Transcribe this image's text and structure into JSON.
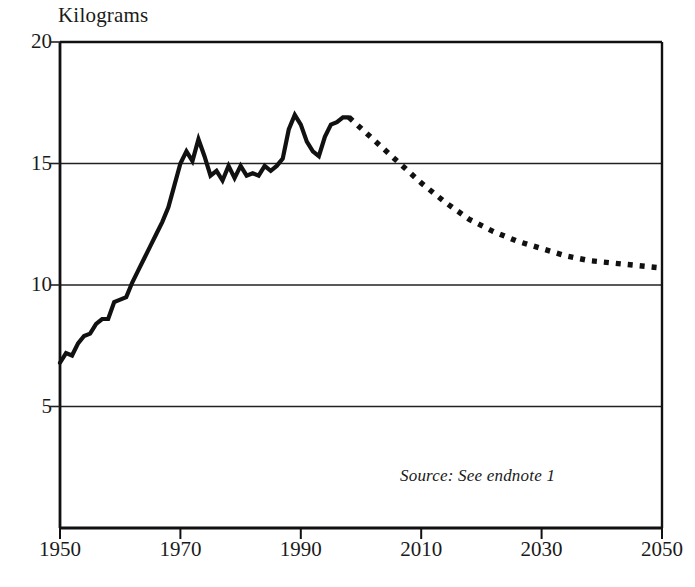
{
  "chart_data": {
    "type": "line",
    "title": "Kilograms",
    "ylabel": "Kilograms",
    "xlabel": "",
    "xlim": [
      1950,
      2050
    ],
    "ylim": [
      0,
      20
    ],
    "yticks": [
      20,
      15,
      10,
      5
    ],
    "xticks": [
      1950,
      1970,
      1990,
      2010,
      2030,
      2050
    ],
    "grid": true,
    "legend": null,
    "annotations": [
      {
        "text": "Source: See endnote 1",
        "x": 2022,
        "y": 2.7,
        "style": "italic"
      }
    ],
    "series": [
      {
        "name": "Historical",
        "style": "solid",
        "color": "#111111",
        "x": [
          1950,
          1951,
          1952,
          1953,
          1954,
          1955,
          1956,
          1957,
          1958,
          1959,
          1960,
          1961,
          1962,
          1963,
          1964,
          1965,
          1966,
          1967,
          1968,
          1969,
          1970,
          1971,
          1972,
          1973,
          1974,
          1975,
          1976,
          1977,
          1978,
          1979,
          1980,
          1981,
          1982,
          1983,
          1984,
          1985,
          1986,
          1987,
          1988,
          1989,
          1990,
          1991,
          1992,
          1993,
          1994,
          1995,
          1996,
          1997,
          1998
        ],
        "values": [
          6.8,
          7.2,
          7.1,
          7.6,
          7.9,
          8.0,
          8.4,
          8.6,
          8.6,
          9.3,
          9.4,
          9.5,
          10.1,
          10.6,
          11.1,
          11.6,
          12.1,
          12.6,
          13.2,
          14.1,
          15.0,
          15.5,
          15.1,
          16.0,
          15.3,
          14.5,
          14.7,
          14.3,
          14.9,
          14.4,
          14.9,
          14.5,
          14.6,
          14.5,
          14.9,
          14.7,
          14.9,
          15.2,
          16.4,
          17.0,
          16.6,
          15.9,
          15.5,
          15.3,
          16.1,
          16.6,
          16.7,
          16.9,
          16.9
        ]
      },
      {
        "name": "Projection",
        "style": "dotted",
        "color": "#111111",
        "x": [
          1998,
          2002,
          2006,
          2010,
          2014,
          2018,
          2022,
          2026,
          2030,
          2034,
          2038,
          2042,
          2046,
          2050
        ],
        "values": [
          16.9,
          16.0,
          15.1,
          14.2,
          13.4,
          12.7,
          12.2,
          11.8,
          11.5,
          11.2,
          11.0,
          10.9,
          10.8,
          10.7
        ]
      }
    ]
  },
  "axes": {
    "y_title": "Kilograms",
    "y_tick_labels": [
      "20",
      "15",
      "10",
      "5"
    ],
    "x_tick_labels": [
      "1950",
      "1970",
      "1990",
      "2010",
      "2030",
      "2050"
    ]
  },
  "source": {
    "text": "Source: See endnote 1"
  }
}
